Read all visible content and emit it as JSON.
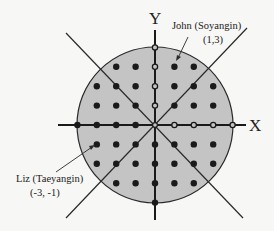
{
  "diagram": {
    "type": "coordinate-grid-circle",
    "axes": {
      "x_label": "X",
      "y_label": "Y"
    },
    "circle_radius_units": 4,
    "grid_points_rule": "integer lattice points inside circle",
    "annotations": [
      {
        "name": "John",
        "role": "Soyangin",
        "text": "John (Soyangin)",
        "coord_text": "(1,3)",
        "point": [
          1,
          3
        ]
      },
      {
        "name": "Liz",
        "role": "Taeyangin",
        "text": "Liz (Taeyangin)",
        "coord_text": "(-3, -1)",
        "point": [
          -3,
          -1
        ]
      }
    ],
    "colors": {
      "circle_fill": "#c4c4c4",
      "stroke": "#2a2a2a",
      "dot": "#1a1a1a",
      "background": "#f7f7f5"
    }
  }
}
